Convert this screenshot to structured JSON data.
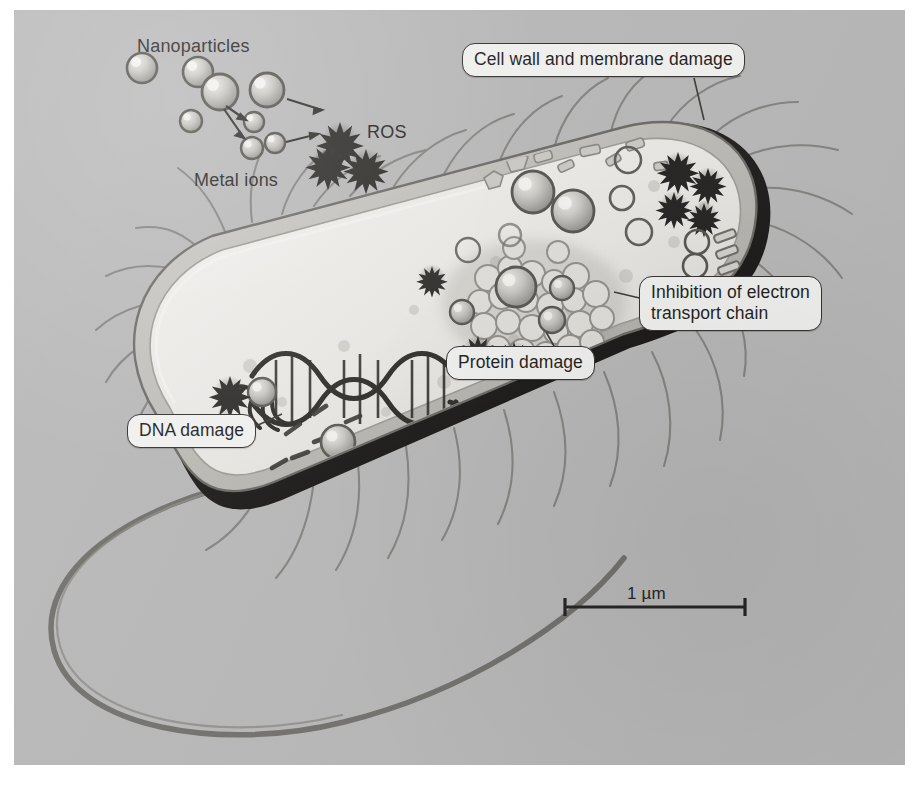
{
  "figure": {
    "kind": "scientific-illustration",
    "background_color": "#b8b8b8",
    "ink_color": "#3a3936"
  },
  "labels": {
    "nanoparticles": "Nanoparticles",
    "metal_ions": "Metal ions",
    "ros": "ROS"
  },
  "callouts": [
    {
      "id": "cell-wall",
      "text": "Cell wall and membrane damage"
    },
    {
      "id": "electron-transport",
      "text": "Inhibition of electron\ntransport chain"
    },
    {
      "id": "protein-damage",
      "text": "Protein damage"
    },
    {
      "id": "dna-damage",
      "text": "DNA damage"
    }
  ],
  "scale_bar": {
    "label": "1 µm",
    "length_px": 180,
    "value": 1,
    "unit": "µm"
  },
  "legend_elements": {
    "nanoparticle": "large shaded sphere with dark outline",
    "metal_ion": "small shaded sphere with dark outline",
    "ros": "dark ten-pointed star burst",
    "dna": "double helix ribbon",
    "flagella": "thin curved filaments",
    "membrane": "thick dark outer membrane layer"
  }
}
